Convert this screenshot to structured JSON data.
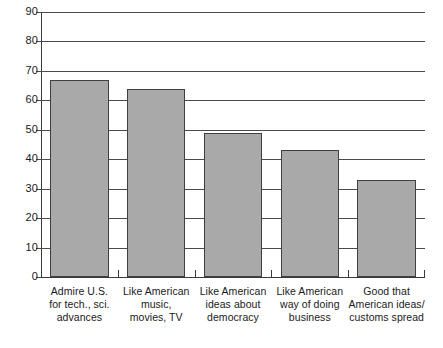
{
  "chart_data": {
    "type": "bar",
    "title": "",
    "subtitle": "",
    "xlabel": "",
    "ylabel": "",
    "ylim": [
      0,
      90
    ],
    "ytick_interval": 10,
    "grid": true,
    "legend": "none",
    "orientation": "vertical",
    "bar_color": "#a9a9a9",
    "bar_border_color": "#3f3f3f",
    "axis_color": "#3a3a3a",
    "categories": [
      "Admire U.S.\nfor tech., sci.\nadvances",
      "Like American\nmusic,\nmovies, TV",
      "Like American\nideas about\ndemocracy",
      "Like American\nway of doing\nbusiness",
      "Good that\nAmerican ideas/\ncustoms spread"
    ],
    "values": [
      67,
      64,
      49,
      43,
      33
    ],
    "ytick_labels": [
      "90",
      "80",
      "70",
      "60",
      "50",
      "40",
      "30",
      "20",
      "10",
      "0"
    ],
    "ytick_values": [
      90,
      80,
      70,
      60,
      50,
      40,
      30,
      20,
      10,
      0
    ]
  }
}
